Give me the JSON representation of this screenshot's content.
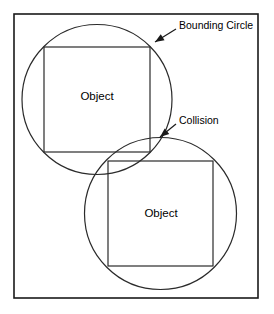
{
  "figure": {
    "background_color": "#ffffff",
    "stroke_color": "#1a1a1a",
    "text_color": "#000000"
  },
  "frame": {
    "name": "diagram-border",
    "x": 14,
    "y": 14,
    "width": 244,
    "height": 284
  },
  "objects": [
    {
      "id": "object-1",
      "label": "Object",
      "square": {
        "x": 44,
        "y": 47,
        "width": 106,
        "height": 105
      },
      "circle": {
        "cx": 97,
        "cy": 99.5,
        "r": 75
      },
      "label_x": 97,
      "label_y": 97
    },
    {
      "id": "object-2",
      "label": "Object",
      "square": {
        "x": 108,
        "y": 161,
        "width": 105,
        "height": 105
      },
      "circle": {
        "cx": 160.5,
        "cy": 213.5,
        "r": 76
      },
      "label_x": 161,
      "label_y": 214
    }
  ],
  "callouts": [
    {
      "id": "bounding-circle-callout",
      "label": "Bounding Circle",
      "text_x": 179,
      "text_y": 26,
      "line_x1": 176,
      "line_y1": 29,
      "line_x2": 155,
      "line_y2": 42,
      "arrow_angle_deg": 149
    },
    {
      "id": "collision-callout",
      "label": "Collision",
      "text_x": 179,
      "text_y": 121,
      "line_x1": 176,
      "line_y1": 124,
      "line_x2": 160,
      "line_y2": 137,
      "arrow_angle_deg": 141
    }
  ]
}
